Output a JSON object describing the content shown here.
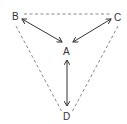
{
  "diagram": {
    "nodes": [
      {
        "id": "A",
        "label": "A"
      },
      {
        "id": "B",
        "label": "B"
      },
      {
        "id": "C",
        "label": "C"
      },
      {
        "id": "D",
        "label": "D"
      }
    ],
    "edges": [
      {
        "from": "B",
        "to": "C",
        "style": "dashed"
      },
      {
        "from": "B",
        "to": "D",
        "style": "dashed"
      },
      {
        "from": "C",
        "to": "D",
        "style": "dashed"
      },
      {
        "from": "A",
        "to": "B",
        "style": "double-arrow"
      },
      {
        "from": "A",
        "to": "C",
        "style": "double-arrow"
      },
      {
        "from": "A",
        "to": "D",
        "style": "double-arrow"
      }
    ],
    "colors": {
      "dashed": "#888888",
      "arrow": "#333333",
      "text": "#333333"
    }
  }
}
